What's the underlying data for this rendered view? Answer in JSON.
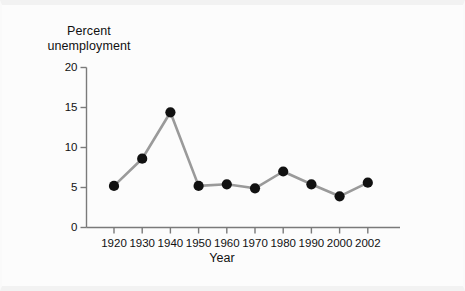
{
  "figure": {
    "background_color": "#fcfcfc",
    "border_color": "#f2f2f2"
  },
  "chart_data": {
    "type": "line",
    "title": "",
    "xlabel": "Year",
    "ylabel": "Percent unemployment",
    "ylabel_line1": "Percent",
    "ylabel_line2": "unemployment",
    "x": [
      1920,
      1930,
      1940,
      1950,
      1960,
      1970,
      1980,
      1990,
      2000,
      2002
    ],
    "categories": [
      "1920",
      "1930",
      "1940",
      "1950",
      "1960",
      "1970",
      "1980",
      "1990",
      "2000",
      "2002"
    ],
    "values": [
      5.2,
      8.6,
      14.4,
      5.2,
      5.4,
      4.9,
      7.0,
      5.4,
      3.9,
      5.6
    ],
    "series": [
      {
        "name": "Percent unemployment",
        "values": [
          5.2,
          8.6,
          14.4,
          5.2,
          5.4,
          4.9,
          7.0,
          5.4,
          3.9,
          5.6
        ]
      }
    ],
    "ylim": [
      0,
      20
    ],
    "yticks": [
      0,
      5,
      10,
      15,
      20
    ],
    "ytick_labels": [
      "0",
      "5",
      "10",
      "15",
      "20"
    ],
    "xtick_labels": [
      "1920",
      "1930",
      "1940",
      "1950",
      "1960",
      "1970",
      "1980",
      "1990",
      "2000",
      "2002"
    ],
    "grid": false,
    "legend": false,
    "line_color": "#9a9a9a",
    "marker_color": "#111111",
    "marker_shape": "circle",
    "axis_color": "#7a7a7a"
  }
}
